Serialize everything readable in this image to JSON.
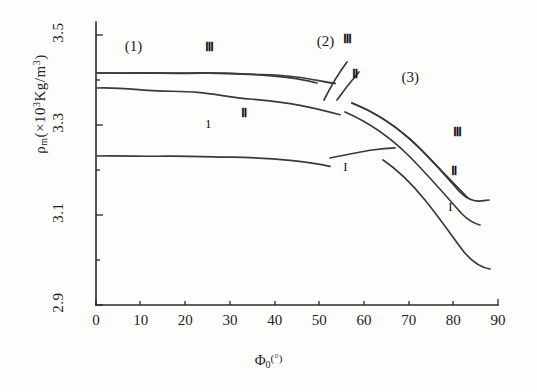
{
  "chart_data": {
    "type": "line",
    "title": "",
    "xlabel": "Φ₀(°)",
    "ylabel": "ρₘ(×10³Kg/m³)",
    "xlim": [
      0,
      90
    ],
    "ylim": [
      2.9,
      3.5
    ],
    "xticks": [
      "0",
      "10",
      "20",
      "30",
      "40",
      "50",
      "60",
      "70",
      "80",
      "90"
    ],
    "yticks": [
      "2.9",
      "3.1",
      "3.3",
      "3.5"
    ],
    "grid": false,
    "legend": "inline-curve-labels",
    "region_labels": [
      {
        "text": "(1)",
        "x": 10,
        "y": 3.47
      },
      {
        "text": "(2)",
        "x": 53,
        "y": 3.48
      },
      {
        "text": "(3)",
        "x": 72,
        "y": 3.4
      }
    ],
    "series": [
      {
        "name": "Ⅲ",
        "label": "Ⅲ",
        "group": "(1)",
        "points": [
          [
            0,
            3.437
          ],
          [
            5,
            3.437
          ],
          [
            10,
            3.437
          ],
          [
            15,
            3.436
          ],
          [
            20,
            3.436
          ],
          [
            25,
            3.435
          ],
          [
            30,
            3.433
          ],
          [
            35,
            3.43
          ],
          [
            40,
            3.426
          ],
          [
            45,
            3.421
          ],
          [
            49,
            3.417
          ]
        ]
      },
      {
        "name": "Ⅱ",
        "label": "Ⅱ",
        "group": "(1)",
        "points": [
          [
            0,
            3.404
          ],
          [
            5,
            3.402
          ],
          [
            10,
            3.399
          ],
          [
            15,
            3.398
          ],
          [
            20,
            3.394
          ],
          [
            25,
            3.39
          ],
          [
            30,
            3.386
          ],
          [
            35,
            3.381
          ],
          [
            40,
            3.376
          ],
          [
            45,
            3.369
          ],
          [
            51,
            3.362
          ]
        ]
      },
      {
        "name": "Ⅰ",
        "label": "1",
        "group": "(1)",
        "points": [
          [
            0,
            3.253
          ],
          [
            5,
            3.252
          ],
          [
            10,
            3.252
          ],
          [
            15,
            3.251
          ],
          [
            20,
            3.251
          ],
          [
            25,
            3.25
          ],
          [
            30,
            3.249
          ],
          [
            35,
            3.247
          ],
          [
            40,
            3.244
          ],
          [
            45,
            3.24
          ],
          [
            50,
            3.235
          ]
        ]
      },
      {
        "name": "Ⅲ-transition",
        "label": "Ⅲ",
        "group": "(2)",
        "points": [
          [
            51,
            3.412
          ],
          [
            53,
            3.438
          ],
          [
            55,
            3.462
          ],
          [
            56,
            3.472
          ]
        ]
      },
      {
        "name": "Ⅱ-transition",
        "label": "Ⅱ",
        "group": "(2)",
        "points": [
          [
            54,
            3.398
          ],
          [
            55.5,
            3.424
          ],
          [
            57,
            3.447
          ]
        ]
      },
      {
        "name": "Ⅲ-descending",
        "label": "Ⅲ",
        "group": "(3)",
        "points": [
          [
            57,
            3.392
          ],
          [
            62,
            3.372
          ],
          [
            67,
            3.346
          ],
          [
            72,
            3.313
          ],
          [
            77,
            3.271
          ],
          [
            82,
            3.222
          ],
          [
            86,
            3.176
          ],
          [
            90,
            3.128
          ]
        ]
      },
      {
        "name": "Ⅱ-descending",
        "label": "Ⅱ",
        "group": "(3)",
        "points": [
          [
            56,
            3.372
          ],
          [
            61,
            3.351
          ],
          [
            66,
            3.325
          ],
          [
            71,
            3.292
          ],
          [
            76,
            3.249
          ],
          [
            81,
            3.199
          ],
          [
            86,
            3.143
          ],
          [
            90,
            3.095
          ]
        ]
      },
      {
        "name": "Ⅰ-plateau",
        "label": "I",
        "group": "(3)",
        "points": [
          [
            52,
            3.232
          ],
          [
            56,
            3.24
          ],
          [
            60,
            3.248
          ],
          [
            63,
            3.253
          ]
        ]
      },
      {
        "name": "Ⅰ-descending",
        "label": "I",
        "group": "(3)",
        "points": [
          [
            64,
            3.228
          ],
          [
            68,
            3.206
          ],
          [
            72,
            3.176
          ],
          [
            76,
            3.138
          ],
          [
            80,
            3.095
          ],
          [
            85,
            3.035
          ],
          [
            90,
            2.982
          ]
        ]
      }
    ],
    "curve_tags": [
      {
        "text": "Ⅲ",
        "x": 25.5,
        "y": 3.472,
        "style": "bold"
      },
      {
        "text": "Ⅱ",
        "x": 33.5,
        "y": 3.325,
        "style": "bold"
      },
      {
        "text": "1",
        "x": 25.5,
        "y": 3.3,
        "style": "thin"
      },
      {
        "text": "Ⅲ",
        "x": 56.5,
        "y": 3.49,
        "style": "bold"
      },
      {
        "text": "Ⅱ",
        "x": 58.5,
        "y": 3.412,
        "style": "bold"
      },
      {
        "text": "Ⅲ",
        "x": 81.0,
        "y": 3.282,
        "style": "bold"
      },
      {
        "text": "Ⅱ",
        "x": 80.5,
        "y": 3.196,
        "style": "bold"
      },
      {
        "text": "I",
        "x": 56.5,
        "y": 3.205,
        "style": "thin"
      },
      {
        "text": "I",
        "x": 80.0,
        "y": 3.115,
        "style": "thin"
      }
    ]
  },
  "axis": {
    "y_title_main": "ρ",
    "y_title_sub": "m",
    "y_title_rest_open": "(×10",
    "y_title_exp": "3",
    "y_title_mid": "Kg/m",
    "y_title_exp2": "3",
    "y_title_close": ")",
    "x_title_main": "Φ",
    "x_title_sub": "0",
    "x_title_unit": "(°)"
  }
}
